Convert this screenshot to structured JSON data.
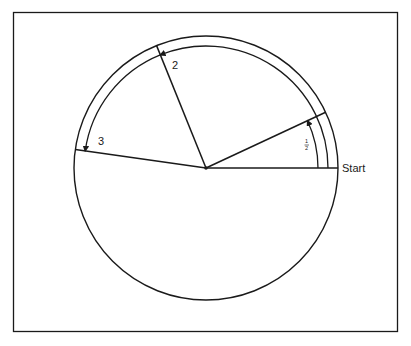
{
  "diagram": {
    "type": "circle-rotation-diagram",
    "labels": {
      "start": "Start",
      "half": "1/2",
      "half_num": "1",
      "half_den": "2",
      "two": "2",
      "three": "3"
    },
    "colors": {
      "stroke": "#1a1a1a",
      "background": "#ffffff"
    },
    "geometry": {
      "center": [
        206,
        168
      ],
      "radius": 132,
      "radii_angles_deg": [
        0,
        25,
        112,
        172
      ],
      "arc_bands": [
        {
          "label": "1/2",
          "from_deg": 0,
          "to_deg": 25,
          "radius": 112
        },
        {
          "label": "2",
          "from_deg": 0,
          "to_deg": 112,
          "radius": 122
        },
        {
          "label": "3",
          "from_deg": 112,
          "to_deg": 172,
          "radius": 122
        }
      ]
    }
  }
}
